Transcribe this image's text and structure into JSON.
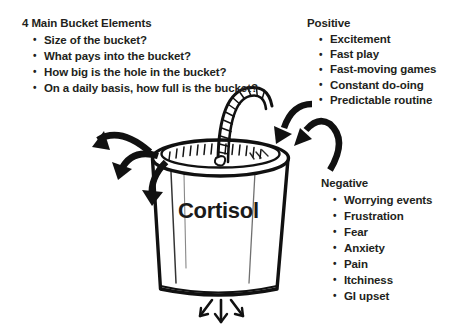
{
  "page": {
    "background_color": "#ffffff",
    "ink_color": "#1a1a1a",
    "width": 472,
    "height": 335
  },
  "left_block": {
    "heading": "4 Main Bucket Elements",
    "items": [
      "Size of the bucket?",
      "What pays into the bucket?",
      "How big is the hole in the bucket?",
      "On a daily basis, how full is the bucket?"
    ]
  },
  "positive_block": {
    "heading": "Positive",
    "items": [
      "Excitement",
      "Fast play",
      "Fast-moving games",
      "Constant do-oing",
      "Predictable routine"
    ]
  },
  "negative_block": {
    "heading": "Negative",
    "items": [
      "Worrying events",
      "Frustration",
      "Fear",
      "Anxiety",
      "Pain",
      "Itchiness",
      "GI upset"
    ]
  },
  "illustration": {
    "bucket_label": "Cortisol",
    "icons": {
      "bucket": "bucket-icon",
      "bucket_handle": "bucket-handle-icon",
      "bucket_rim": "bucket-rim-icon",
      "inflow_arrows_right": "inflow-arrow-icon",
      "outflow_arrows_left": "outflow-arrow-icon",
      "leak_arrows_bottom": "leak-arrow-icon"
    },
    "arrow_counts": {
      "left_outflow": 3,
      "right_inflow": 2,
      "bottom_leak": 3
    }
  }
}
